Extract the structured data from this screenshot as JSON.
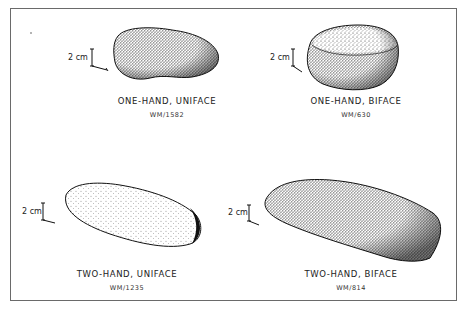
{
  "figure": {
    "panels": [
      {
        "id": "one-hand-uniface",
        "title": "ONE-HAND, UNIFACE",
        "catalog": "WM/1582",
        "scale": "2 cm"
      },
      {
        "id": "one-hand-biface",
        "title": "ONE-HAND, BIFACE",
        "catalog": "WM/630",
        "scale": "2 cm"
      },
      {
        "id": "two-hand-uniface",
        "title": "TWO-HAND, UNIFACE",
        "catalog": "WM/1235",
        "scale": "2 cm"
      },
      {
        "id": "two-hand-biface",
        "title": "TWO-HAND, BIFACE",
        "catalog": "WM/814",
        "scale": "2 cm"
      }
    ],
    "colors": {
      "ink": "#1a1a1a",
      "paper": "#ffffff",
      "frame": "#6a6a6a"
    }
  }
}
